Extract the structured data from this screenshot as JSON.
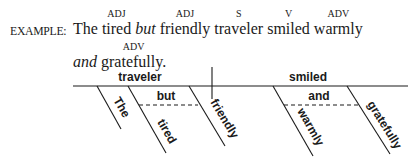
{
  "example": {
    "label": "EXAMPLE:",
    "line1": [
      {
        "text": "The",
        "pos": "",
        "italic": false
      },
      {
        "text": "tired",
        "pos": "ADJ",
        "italic": false
      },
      {
        "text": "but",
        "pos": "",
        "italic": true
      },
      {
        "text": "friendly",
        "pos": "ADJ",
        "italic": false
      },
      {
        "text": "traveler",
        "pos": "S",
        "italic": false
      },
      {
        "text": "smiled",
        "pos": "V",
        "italic": false
      },
      {
        "text": "warmly",
        "pos": "ADV",
        "italic": false
      }
    ],
    "line2": [
      {
        "text": "and",
        "pos": "",
        "italic": true
      },
      {
        "text": "gratefully.",
        "pos": "ADV",
        "italic": false
      }
    ]
  },
  "diagram": {
    "subject": "traveler",
    "verb": "smiled",
    "subject_modifiers": [
      "The",
      "tired",
      "friendly"
    ],
    "subject_conjunction": "but",
    "verb_modifiers": [
      "warmly",
      "gratefully"
    ],
    "verb_conjunction": "and"
  }
}
